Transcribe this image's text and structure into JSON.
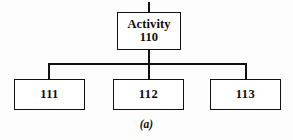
{
  "figure": {
    "caption": "(a)",
    "line_color": "#111111",
    "background_color": "#fdfdfd",
    "text_color": "#0d0d0d"
  },
  "tree": {
    "root": {
      "title": "Activity",
      "number": "110"
    },
    "children": [
      {
        "number": "111"
      },
      {
        "number": "112"
      },
      {
        "number": "113"
      }
    ]
  }
}
